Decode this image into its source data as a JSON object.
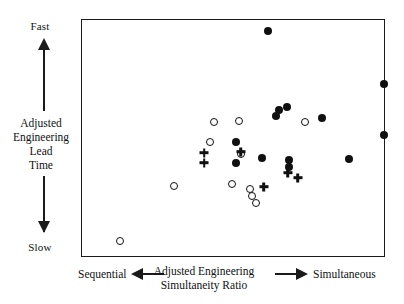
{
  "figure": {
    "background": "#ffffff",
    "ink_color": "#101010"
  },
  "axes": {
    "y": {
      "title_lines": [
        "Adjusted",
        "Engineering",
        "Lead",
        "Time"
      ],
      "high_label": "Fast",
      "low_label": "Slow",
      "up_arrow_icon": "arrow-up-icon",
      "down_arrow_icon": "arrow-down-icon"
    },
    "x": {
      "title_lines": [
        "Adjusted Engineering",
        "Simultaneity Ratio"
      ],
      "left_label": "Sequential",
      "right_label": "Simultaneous",
      "left_arrow_icon": "arrow-left-icon",
      "right_arrow_icon": "arrow-right-icon"
    }
  },
  "chart_data": {
    "type": "scatter",
    "title": "",
    "xlabel": "Adjusted Engineering Simultaneity Ratio",
    "ylabel": "Adjusted Engineering Lead Time",
    "xlim": [
      0,
      100
    ],
    "ylim": [
      0,
      100
    ],
    "grid": false,
    "legend_position": "none",
    "axis_direction_notes": {
      "x_low": "Sequential",
      "x_high": "Simultaneous",
      "y_low": "Slow",
      "y_high": "Fast"
    },
    "series": [
      {
        "name": "filled-circle",
        "marker": "filled-circle",
        "points": [
          [
            61.5,
            95.4
          ],
          [
            67.8,
            63.0
          ],
          [
            65.1,
            61.7
          ],
          [
            64.1,
            59.2
          ],
          [
            79.6,
            58.4
          ],
          [
            100.0,
            72.7
          ],
          [
            100.0,
            51.3
          ],
          [
            88.5,
            41.2
          ],
          [
            59.5,
            41.6
          ],
          [
            68.4,
            40.8
          ],
          [
            68.4,
            37.8
          ],
          [
            51.0,
            48.3
          ],
          [
            51.0,
            39.5
          ]
        ]
      },
      {
        "name": "open-circle",
        "marker": "open-circle",
        "points": [
          [
            43.8,
            56.7
          ],
          [
            52.0,
            57.1
          ],
          [
            42.4,
            48.3
          ],
          [
            52.6,
            43.3
          ],
          [
            74.0,
            56.7
          ],
          [
            30.6,
            29.8
          ],
          [
            49.7,
            30.3
          ],
          [
            55.6,
            28.2
          ],
          [
            56.3,
            25.6
          ],
          [
            57.6,
            22.3
          ],
          [
            12.5,
            6.3
          ]
        ]
      },
      {
        "name": "plus",
        "marker": "plus",
        "points": [
          [
            40.5,
            43.7
          ],
          [
            40.5,
            39.5
          ],
          [
            52.6,
            44.1
          ],
          [
            68.1,
            35.3
          ],
          [
            71.4,
            33.2
          ],
          [
            60.2,
            29.4
          ]
        ]
      }
    ]
  }
}
